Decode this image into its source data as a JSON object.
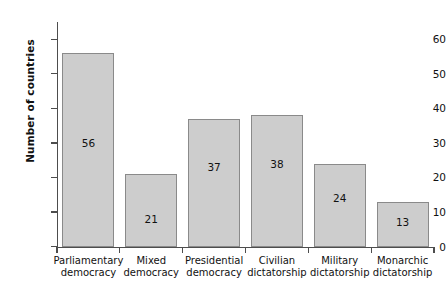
{
  "chart_data": {
    "type": "bar",
    "title": "",
    "xlabel": "",
    "ylabel": "Number of countries",
    "categories": [
      "Parliamentary democracy",
      "Mixed democracy",
      "Presidential democracy",
      "Civilian dictatorship",
      "Military dictatorship",
      "Monarchic dictatorship"
    ],
    "category_lines": [
      [
        "Parliamentary",
        "democracy"
      ],
      [
        "Mixed",
        "democracy"
      ],
      [
        "Presidential",
        "democracy"
      ],
      [
        "Civilian",
        "dictatorship"
      ],
      [
        "Military",
        "dictatorship"
      ],
      [
        "Monarchic",
        "dictatorship"
      ]
    ],
    "values": [
      56,
      21,
      37,
      38,
      24,
      13
    ],
    "value_labels": [
      "56",
      "21",
      "37",
      "38",
      "24",
      "13"
    ],
    "label_positions": [
      30,
      8,
      23,
      24,
      14,
      7
    ],
    "ylim": [
      0,
      65
    ],
    "yticks": [
      0,
      10,
      20,
      30,
      40,
      50,
      60
    ],
    "ytick_labels": [
      "0",
      "10",
      "20",
      "30",
      "40",
      "50",
      "60"
    ],
    "grid": false,
    "legend": null,
    "colors": {
      "bar_fill": "#cdcdcd",
      "bar_border": "#8a8a8a",
      "axis": "#4d4d4d",
      "text": "#111111",
      "background": "#ffffff"
    }
  }
}
